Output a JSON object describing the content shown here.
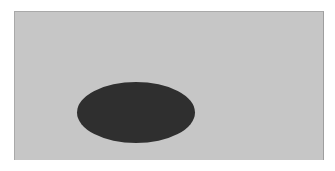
{
  "scene": {
    "panel": {
      "shape": "rectangle",
      "color": "#c6c6c6",
      "border_color": "#a9a9a9"
    },
    "ellipse": {
      "shape": "ellipse",
      "color": "#2f2f2f"
    }
  }
}
